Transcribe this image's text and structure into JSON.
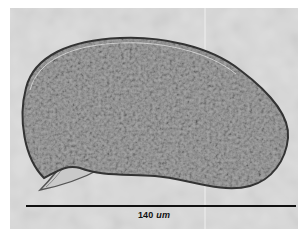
{
  "image": {
    "subject": "elongated protozoan cell with granular cytoplasm and pointed posterior spike",
    "background_color": "#d9d9d9",
    "cell_fill_color": "#9a9a9a",
    "cell_outline_color": "#3a3a3a"
  },
  "scale_bar": {
    "value": "140",
    "unit": "um",
    "color": "#111111"
  }
}
